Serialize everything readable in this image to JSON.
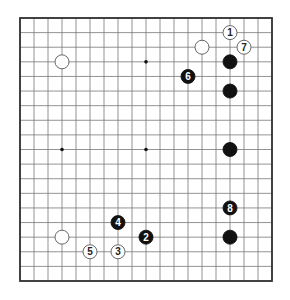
{
  "board": {
    "size": 19,
    "left": 20,
    "top": 18,
    "right": 272,
    "bottom": 281,
    "line_color": "#777777",
    "border_color": "#333333",
    "stone_radius": 7,
    "star_points": [
      [
        3,
        3
      ],
      [
        9,
        3
      ],
      [
        15,
        3
      ],
      [
        3,
        9
      ],
      [
        9,
        9
      ],
      [
        15,
        9
      ],
      [
        3,
        15
      ],
      [
        9,
        15
      ],
      [
        15,
        15
      ]
    ]
  },
  "stones": [
    {
      "color": "white",
      "col": 3,
      "row": 3,
      "label": ""
    },
    {
      "color": "white",
      "col": 13,
      "row": 2,
      "label": ""
    },
    {
      "color": "white",
      "col": 15,
      "row": 1,
      "label": "1"
    },
    {
      "color": "white",
      "col": 16,
      "row": 2,
      "label": "7"
    },
    {
      "color": "black",
      "col": 15,
      "row": 3,
      "label": ""
    },
    {
      "color": "black",
      "col": 12,
      "row": 4,
      "label": "6"
    },
    {
      "color": "black",
      "col": 15,
      "row": 5,
      "label": ""
    },
    {
      "color": "black",
      "col": 15,
      "row": 9,
      "label": ""
    },
    {
      "color": "black",
      "col": 15,
      "row": 13,
      "label": "8"
    },
    {
      "color": "black",
      "col": 15,
      "row": 15,
      "label": ""
    },
    {
      "color": "black",
      "col": 7,
      "row": 14,
      "label": "4"
    },
    {
      "color": "black",
      "col": 9,
      "row": 15,
      "label": "2"
    },
    {
      "color": "white",
      "col": 3,
      "row": 15,
      "label": ""
    },
    {
      "color": "white",
      "col": 5,
      "row": 16,
      "label": "5"
    },
    {
      "color": "white",
      "col": 7,
      "row": 16,
      "label": "3"
    }
  ]
}
